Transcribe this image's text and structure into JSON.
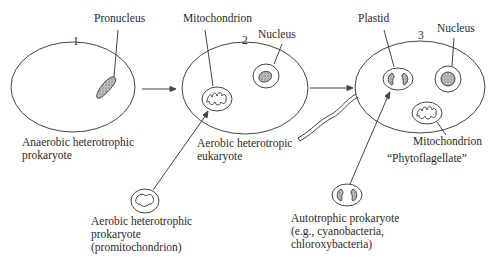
{
  "diagram": {
    "type": "endosymbiosis",
    "stages": [
      {
        "number": "1",
        "label": "Anaerobic heterotrophic\nprokaryote",
        "parts": [
          "Pronucleus"
        ]
      },
      {
        "number": "2",
        "label": "Aerobic heterotropic\neukaryote",
        "parts": [
          "Mitochondrion",
          "Nucleus"
        ]
      },
      {
        "number": "3",
        "label": "“Phytoflagellate”",
        "parts": [
          "Plastid",
          "Nucleus",
          "Mitochondrion"
        ]
      }
    ],
    "donors": [
      {
        "label": "Aerobic heterotrophic\nprokaryote\n(promitochondrion)"
      },
      {
        "label": "Autotrophic prokaryote\n(e.g., cyanobacteria,\nchloroxybacteria)"
      }
    ],
    "colors": {
      "line": "#444444",
      "fill_stipple": "#9a9a9a",
      "background": "#ffffff"
    }
  }
}
